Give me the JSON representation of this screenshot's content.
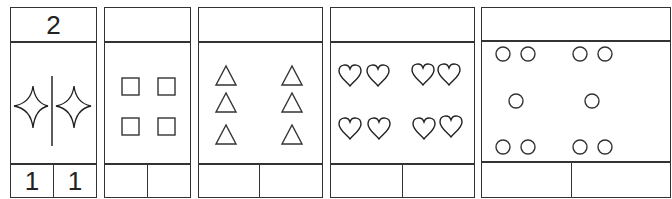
{
  "cards": [
    {
      "id": "stars",
      "header": "2",
      "shape": "four-point-star",
      "shape_count": 2,
      "has_center_divider": true,
      "footer": [
        "1",
        "1"
      ]
    },
    {
      "id": "squares",
      "header": "",
      "shape": "square",
      "shape_count": 4,
      "footer": [
        "",
        ""
      ]
    },
    {
      "id": "triangles",
      "header": "",
      "shape": "triangle",
      "shape_count": 6,
      "footer": [
        "",
        ""
      ]
    },
    {
      "id": "hearts",
      "header": "",
      "shape": "heart",
      "shape_count": 8,
      "footer": [
        "",
        ""
      ]
    },
    {
      "id": "circles",
      "header": "",
      "shape": "circle",
      "shape_count": 10,
      "footer": [
        "",
        ""
      ]
    }
  ],
  "colors": {
    "line": "#333333",
    "background": "#ffffff"
  }
}
